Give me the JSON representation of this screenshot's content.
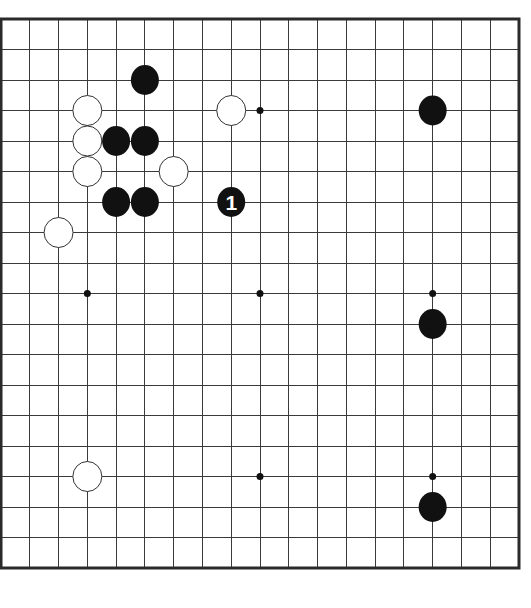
{
  "diagram": {
    "type": "go-board",
    "size": 19,
    "colors": {
      "background": "#ffffff",
      "grid": "#3a3a3a",
      "border": "#2a2a2a",
      "black": "#111111",
      "white": "#ffffff",
      "white_outline": "#333333",
      "label_on_black": "#ffffff"
    },
    "geometry": {
      "x0": 1,
      "y0": 19,
      "x1": 519,
      "y1": 568
    },
    "star_points": [
      [
        3,
        3
      ],
      [
        9,
        3
      ],
      [
        15,
        3
      ],
      [
        3,
        9
      ],
      [
        9,
        9
      ],
      [
        15,
        9
      ],
      [
        3,
        15
      ],
      [
        9,
        15
      ],
      [
        15,
        15
      ]
    ],
    "stones": [
      {
        "color": "black",
        "col": 5,
        "row": 2
      },
      {
        "color": "white",
        "col": 3,
        "row": 3
      },
      {
        "color": "white",
        "col": 8,
        "row": 3
      },
      {
        "color": "black",
        "col": 15,
        "row": 3
      },
      {
        "color": "white",
        "col": 3,
        "row": 4
      },
      {
        "color": "black",
        "col": 4,
        "row": 4
      },
      {
        "color": "black",
        "col": 5,
        "row": 4
      },
      {
        "color": "white",
        "col": 3,
        "row": 5
      },
      {
        "color": "white",
        "col": 6,
        "row": 5
      },
      {
        "color": "black",
        "col": 4,
        "row": 6
      },
      {
        "color": "black",
        "col": 5,
        "row": 6
      },
      {
        "color": "black",
        "col": 8,
        "row": 6,
        "label": "1"
      },
      {
        "color": "white",
        "col": 2,
        "row": 7
      },
      {
        "color": "black",
        "col": 15,
        "row": 10
      },
      {
        "color": "white",
        "col": 3,
        "row": 15
      },
      {
        "color": "black",
        "col": 15,
        "row": 16
      }
    ]
  }
}
